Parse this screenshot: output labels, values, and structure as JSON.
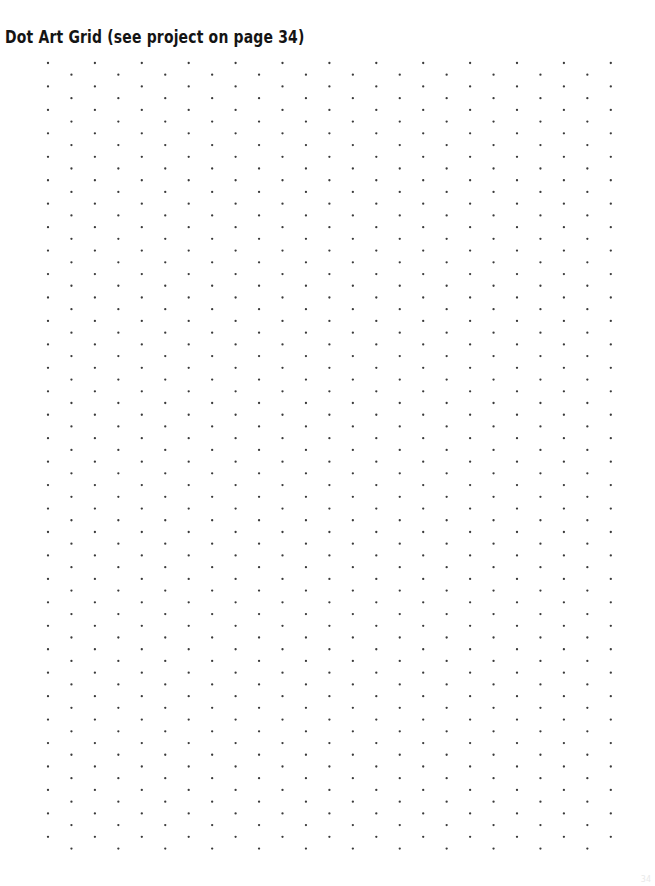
{
  "document": {
    "background_color": "#ffffff",
    "width": 655,
    "height": 886,
    "title": "Dot Art Grid (see project on page 34)",
    "title_color": "#141414",
    "page_number": "34"
  },
  "dot_grid": {
    "label": "dot-grid",
    "dot_color": "#3a3a3a",
    "dot_radius": 1.15,
    "column_spacing": 23.45,
    "row_spacing": 23.45,
    "stagger_offset": 11.72,
    "origin_x": 48,
    "origin_y": 63,
    "left": 40,
    "top": 58,
    "right": 620,
    "bottom": 856,
    "columns": 25,
    "rows": 35,
    "pattern": "staggered-offset-columns"
  }
}
